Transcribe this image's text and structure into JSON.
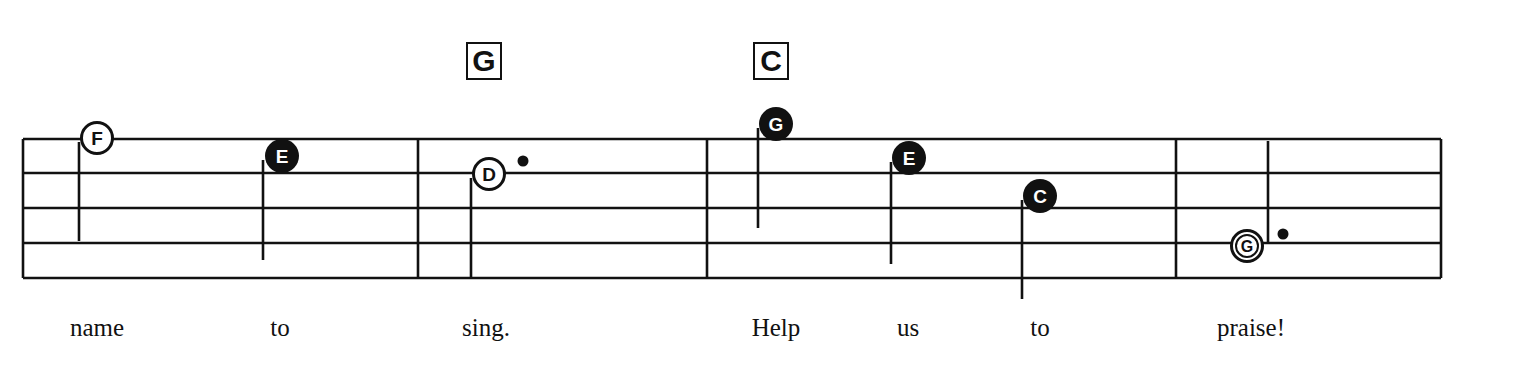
{
  "chords": [
    {
      "label": "G",
      "x": 466,
      "y": 42
    },
    {
      "label": "C",
      "x": 753,
      "y": 42
    }
  ],
  "staff": {
    "lines_y": [
      139,
      173,
      208,
      243,
      278
    ],
    "x_start": 23,
    "x_end": 1441,
    "barlines_x": [
      23,
      418,
      707,
      1176,
      1441
    ]
  },
  "notes": [
    {
      "letter": "F",
      "cx": 97,
      "cy": 138,
      "filled": false,
      "stem_x": 79,
      "stem_top": 142,
      "stem_bottom": 241,
      "dot": false
    },
    {
      "letter": "E",
      "cx": 282,
      "cy": 156,
      "filled": true,
      "stem_x": 263,
      "stem_top": 160,
      "stem_bottom": 260,
      "dot": false
    },
    {
      "letter": "D",
      "cx": 489,
      "cy": 174,
      "filled": false,
      "stem_x": 471,
      "stem_top": 178,
      "stem_bottom": 278,
      "dot": true,
      "dot_x": 523,
      "dot_y": 161
    },
    {
      "letter": "G",
      "cx": 776,
      "cy": 124,
      "filled": true,
      "stem_x": 758,
      "stem_top": 128,
      "stem_bottom": 228,
      "dot": false
    },
    {
      "letter": "E",
      "cx": 909,
      "cy": 158,
      "filled": true,
      "stem_x": 891,
      "stem_top": 162,
      "stem_bottom": 264,
      "dot": false
    },
    {
      "letter": "C",
      "cx": 1040,
      "cy": 196,
      "filled": true,
      "stem_x": 1022,
      "stem_top": 200,
      "stem_bottom": 299,
      "dot": false
    },
    {
      "letter": "G",
      "cx": 1247,
      "cy": 246,
      "filled": false,
      "double_ring": true,
      "stem_x": 1268,
      "stem_top": 141,
      "stem_bottom": 242,
      "dot": true,
      "dot_x": 1283,
      "dot_y": 234
    }
  ],
  "lyrics": [
    {
      "text": "name",
      "x": 97
    },
    {
      "text": "to",
      "x": 280
    },
    {
      "text": "sing.",
      "x": 486
    },
    {
      "text": "Help",
      "x": 776
    },
    {
      "text": "us",
      "x": 908
    },
    {
      "text": "to",
      "x": 1040
    },
    {
      "text": "praise!",
      "x": 1251
    }
  ],
  "colors": {
    "ink": "#111111",
    "paper": "#ffffff"
  }
}
